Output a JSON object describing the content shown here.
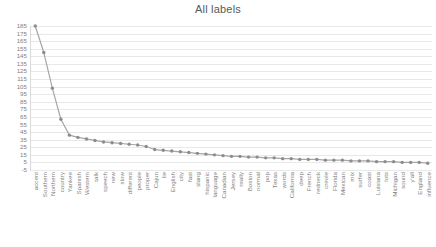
{
  "chart_data": {
    "type": "line",
    "title": "All labels",
    "xlabel": "",
    "ylabel": "",
    "ylim": [
      -5,
      185
    ],
    "ytick_step": 10,
    "grid": true,
    "legend": false,
    "legend_position": "none",
    "marker": "circle",
    "line_color": "#a6a6a6",
    "marker_color": "#8c8c8c",
    "gridline_color": "#e8e8e8",
    "axis_color": "#d9d9d9",
    "text_color": "#808080",
    "title_color": "#595959",
    "yticks": [
      -5,
      5,
      15,
      25,
      35,
      45,
      55,
      65,
      75,
      85,
      95,
      105,
      115,
      125,
      135,
      145,
      155,
      165,
      175,
      185
    ],
    "categories": [
      "accent",
      "Southern",
      "Northern",
      "country",
      "Yankee",
      "Spanish",
      "Western",
      "talk",
      "speech",
      "new",
      "slow",
      "different",
      "people",
      "proper",
      "Cajun",
      "lie",
      "English",
      "city",
      "fast",
      "slang",
      "hispanic",
      "language",
      "Canadian",
      "Jersey",
      "really",
      "Boston",
      "normal",
      "pop",
      "Texas",
      "words",
      "California",
      "deep",
      "French",
      "redneck",
      "creole",
      "Florida",
      "Mexican",
      "mix",
      "surfer",
      "coast",
      "Luisiana",
      "lots",
      "Michigan",
      "sound",
      "y'all",
      "England",
      "influence"
    ],
    "values": [
      185,
      150,
      103,
      62,
      41,
      38,
      36,
      34,
      32,
      31,
      30,
      29,
      28,
      26,
      22,
      21,
      20,
      19,
      18,
      17,
      16,
      15,
      14,
      13,
      13,
      12,
      12,
      11,
      11,
      10,
      10,
      9,
      9,
      9,
      8,
      8,
      8,
      7,
      7,
      7,
      6,
      6,
      6,
      5,
      5,
      5,
      4
    ]
  }
}
